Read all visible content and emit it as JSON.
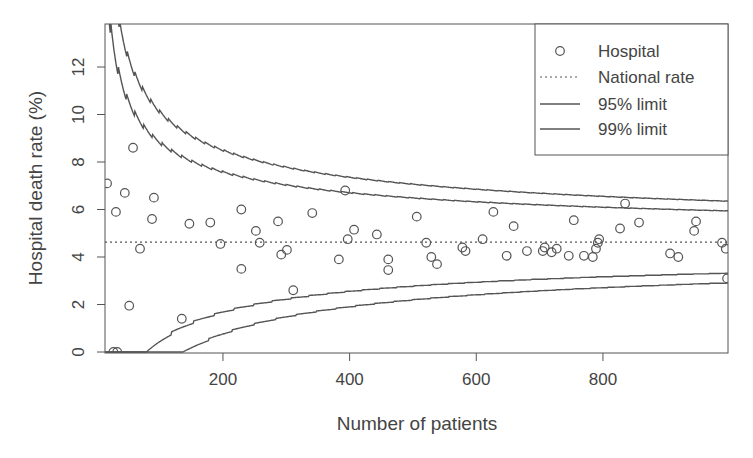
{
  "chart_data": {
    "type": "scatter",
    "title": "",
    "xlabel": "Number of patients",
    "ylabel": "Hospital death rate (%)",
    "xlim": [
      14,
      998
    ],
    "ylim": [
      0,
      13.7
    ],
    "x_ticks": [
      200,
      400,
      600,
      800
    ],
    "y_ticks": [
      0,
      2,
      4,
      6,
      8,
      10,
      12
    ],
    "grid": false,
    "legend_position": "top-right",
    "legend": [
      {
        "label": "Hospital",
        "symbol": "open-circle"
      },
      {
        "label": "National rate",
        "symbol": "dotted-line"
      },
      {
        "label": "95% limit",
        "symbol": "solid-line"
      },
      {
        "label": "99% limit",
        "symbol": "solid-line"
      }
    ],
    "national_rate": 4.63,
    "limits": {
      "description": "Funnel control limits (binomial, sawtooth), upper and lower for 95% and 99%",
      "z95": 1.96,
      "z99": 2.576
    },
    "series": [
      {
        "name": "Hospital",
        "x": [
          17,
          27,
          33,
          31,
          45,
          52,
          58,
          69,
          88,
          91,
          135,
          147,
          180,
          196,
          229,
          229,
          252,
          258,
          287,
          292,
          301,
          311,
          341,
          383,
          393,
          397,
          407,
          443,
          461,
          461,
          506,
          521,
          529,
          538,
          578,
          583,
          610,
          627,
          648,
          659,
          680,
          705,
          708,
          719,
          727,
          746,
          754,
          770,
          784,
          789,
          792,
          794,
          827,
          835,
          857,
          906,
          919,
          944,
          947,
          988,
          994,
          996
        ],
        "y": [
          7.1,
          0,
          0,
          5.9,
          6.7,
          1.95,
          8.6,
          4.35,
          5.6,
          6.5,
          1.4,
          5.4,
          5.45,
          4.55,
          6.0,
          3.5,
          5.1,
          4.6,
          5.5,
          4.1,
          4.3,
          2.6,
          5.85,
          3.9,
          6.8,
          4.75,
          5.15,
          4.95,
          3.9,
          3.45,
          5.7,
          4.6,
          4.0,
          3.7,
          4.4,
          4.25,
          4.75,
          5.9,
          4.05,
          5.3,
          4.25,
          4.25,
          4.4,
          4.2,
          4.35,
          4.05,
          5.55,
          4.05,
          4.0,
          4.35,
          4.6,
          4.75,
          5.2,
          6.25,
          5.45,
          4.15,
          4.0,
          5.1,
          5.5,
          4.6,
          4.35,
          3.1
        ]
      }
    ]
  }
}
